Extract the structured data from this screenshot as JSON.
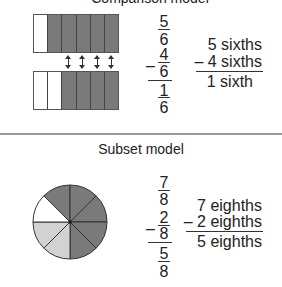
{
  "colors": {
    "shaded": "#7a7a7a",
    "light": "#d2d2d2",
    "empty": "#ffffff"
  },
  "comparison": {
    "title": "Comparison model",
    "top_bar": [
      "empty",
      "shaded",
      "shaded",
      "shaded",
      "shaded",
      "shaded"
    ],
    "bottom_bar": [
      "empty",
      "empty",
      "shaded",
      "shaded",
      "shaded",
      "shaded"
    ],
    "arrows_count": 4,
    "fraction": {
      "a_num": "5",
      "a_den": "6",
      "minus": "–",
      "b_num": "4",
      "b_den": "6",
      "r_num": "1",
      "r_den": "6"
    },
    "words": {
      "line1": "5 sixths",
      "line2": "– 4 sixths",
      "line3": "1 sixth"
    }
  },
  "subset": {
    "title": "Subset model",
    "pie_slices": [
      "shaded",
      "shaded",
      "shaded",
      "shaded",
      "shaded",
      "light",
      "light",
      "empty"
    ],
    "fraction": {
      "a_num": "7",
      "a_den": "8",
      "minus": "–",
      "b_num": "2",
      "b_den": "8",
      "r_num": "5",
      "r_den": "8"
    },
    "words": {
      "line1": "7 eighths",
      "line2": "– 2 eighths",
      "line3": "5 eighths"
    }
  }
}
